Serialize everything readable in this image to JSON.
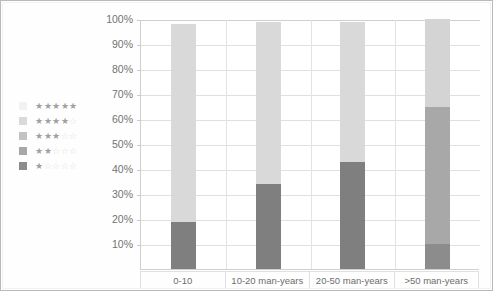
{
  "chart_data": {
    "type": "bar",
    "stacked": true,
    "title": "",
    "subtitle": "",
    "xlabel": "",
    "ylabel": "",
    "categories": [
      "0-10",
      "10-20 man-years",
      "20-50 man-years",
      ">50 man-years"
    ],
    "ylim": [
      0,
      100
    ],
    "ytick_labels": [
      "100%",
      "90%",
      "80%",
      "70%",
      "60%",
      "50%",
      "40%",
      "30%",
      "20%",
      "10%"
    ],
    "ytick_values": [
      100,
      90,
      80,
      70,
      60,
      50,
      40,
      30,
      20,
      10
    ],
    "grid": true,
    "legend_position": "left",
    "series": [
      {
        "name": "1 star",
        "stars_filled": 1,
        "color": "#7f7f7f",
        "values": [
          19,
          34,
          43,
          10
        ]
      },
      {
        "name": "2 stars",
        "stars_filled": 2,
        "color": "#a6a6a6",
        "values": [
          0,
          0,
          0,
          55
        ]
      },
      {
        "name": "3 stars",
        "stars_filled": 3,
        "color": "#bfbfbf",
        "values": [
          0,
          0,
          0,
          0
        ]
      },
      {
        "name": "4 stars",
        "stars_filled": 4,
        "color": "#d9d9d9",
        "values": [
          79,
          65,
          56,
          35
        ]
      },
      {
        "name": "5 stars",
        "stars_filled": 5,
        "color": "#f2f2f2",
        "values": [
          0,
          0,
          0,
          0
        ]
      }
    ],
    "bar_segments": [
      [
        {
          "series": "1 star",
          "from": 0,
          "to": 19,
          "color": "#7f7f7f"
        },
        {
          "series": "4 stars",
          "from": 19,
          "to": 98,
          "color": "#d9d9d9"
        }
      ],
      [
        {
          "series": "1 star",
          "from": 0,
          "to": 34,
          "color": "#7f7f7f"
        },
        {
          "series": "4 stars",
          "from": 34,
          "to": 99,
          "color": "#d9d9d9"
        }
      ],
      [
        {
          "series": "1 star",
          "from": 0,
          "to": 43,
          "color": "#7f7f7f"
        },
        {
          "series": "4 stars",
          "from": 43,
          "to": 99,
          "color": "#d9d9d9"
        }
      ],
      [
        {
          "series": "1 star",
          "from": 0,
          "to": 10,
          "color": "#8c8c8c"
        },
        {
          "series": "2 stars",
          "from": 10,
          "to": 65,
          "color": "#a8a8a8"
        },
        {
          "series": "4 stars",
          "from": 65,
          "to": 100,
          "color": "#d4d4d4"
        }
      ]
    ]
  },
  "legend": {
    "rows": [
      {
        "stars_filled": 5,
        "stars_total": 5,
        "label": "5 stars",
        "swatch_color": "#f2f2f2"
      },
      {
        "stars_filled": 4,
        "stars_total": 5,
        "label": "4 stars",
        "swatch_color": "#d9d9d9"
      },
      {
        "stars_filled": 3,
        "stars_total": 5,
        "label": "3 stars",
        "swatch_color": "#c3c3c3"
      },
      {
        "stars_filled": 2,
        "stars_total": 5,
        "label": "2 stars",
        "swatch_color": "#a8a8a8"
      },
      {
        "stars_filled": 1,
        "stars_total": 5,
        "label": "1 star",
        "swatch_color": "#8c8c8c"
      }
    ],
    "star_glyph_filled": "★",
    "star_glyph_empty": "☆"
  },
  "axes": {
    "y_ticks": [
      "100%",
      "90%",
      "80%",
      "70%",
      "60%",
      "50%",
      "40%",
      "30%",
      "20%",
      "10%"
    ],
    "x_categories": [
      "0-10",
      "10-20 man-years",
      "20-50 man-years",
      ">50 man-years"
    ]
  },
  "colors": {
    "grid": "#e0e0e0",
    "axis": "#cfcfcf",
    "text": "#6d6d6d",
    "frame": "#b9b9b9"
  }
}
